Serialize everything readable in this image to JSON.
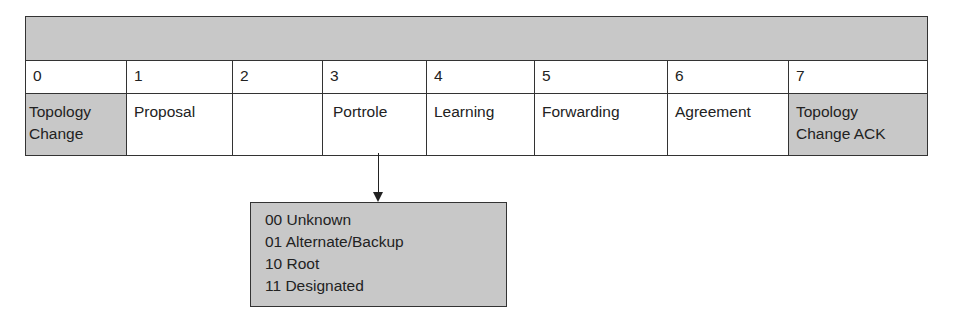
{
  "diagram": {
    "header_bar": "",
    "bits": [
      {
        "num": "0",
        "label": "Topology Change",
        "shaded": true
      },
      {
        "num": "1",
        "label": "Proposal",
        "shaded": false
      },
      {
        "num": "2",
        "label": "",
        "shaded": false
      },
      {
        "num": "3",
        "label": "Portrole",
        "shaded": false
      },
      {
        "num": "4",
        "label": "Learning",
        "shaded": false
      },
      {
        "num": "5",
        "label": "Forwarding",
        "shaded": false
      },
      {
        "num": "6",
        "label": "Agreement",
        "shaded": false
      },
      {
        "num": "7",
        "label": "Topology Change ACK",
        "shaded": true
      }
    ],
    "portrole_values": [
      "00 Unknown",
      "01 Alternate/Backup",
      "10 Root",
      "11 Designated"
    ],
    "colors": {
      "shade": "#c8c8c8",
      "line": "#333333"
    }
  }
}
